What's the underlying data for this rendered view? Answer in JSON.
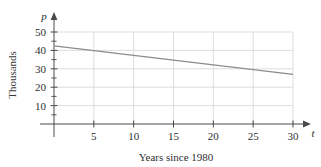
{
  "chart_data": {
    "type": "line",
    "title": "",
    "xlabel": "Years since 1980",
    "ylabel": "Thousands",
    "x_axis_variable": "t",
    "y_axis_variable": "p",
    "xlim": [
      0,
      31.5
    ],
    "ylim": [
      0,
      55
    ],
    "xticks": [
      5,
      10,
      15,
      20,
      25,
      30
    ],
    "xtick_labels": [
      "5",
      "10",
      "15",
      "20",
      "25",
      "30"
    ],
    "yticks": [
      10,
      20,
      30,
      40,
      50
    ],
    "ytick_labels": [
      "10",
      "20",
      "30",
      "40",
      "50"
    ],
    "y_minor_ticks": [
      5,
      15,
      25,
      35,
      45
    ],
    "grid": true,
    "legend": "none",
    "series": [
      {
        "name": "p",
        "x": [
          0,
          30
        ],
        "values": [
          42.5,
          27.0
        ]
      }
    ],
    "colors": {
      "line": "#8c8c8c",
      "grid": "#d9d9d9",
      "axis": "#4a4a4a",
      "text": "#2f2f2f",
      "background": "#ffffff"
    }
  }
}
